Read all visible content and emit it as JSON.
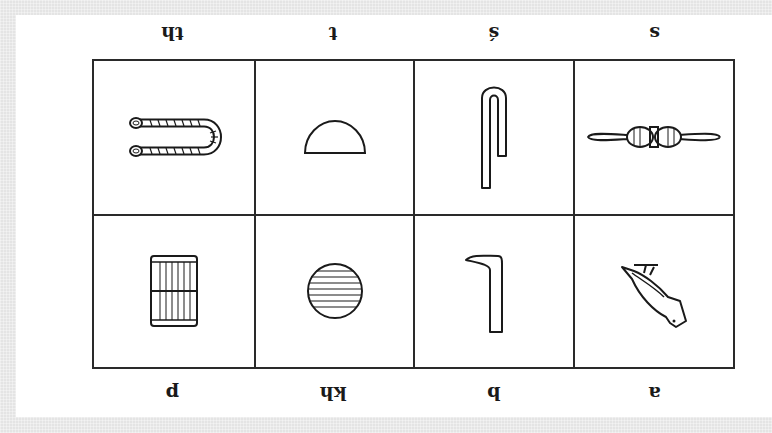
{
  "orientation": "rotated-180",
  "colors": {
    "ink": "#1a1a1a",
    "grid": "#2a2a2a",
    "panel": "#ffffff",
    "frame": "#e4e4e4"
  },
  "rows": [
    {
      "cells": [
        {
          "sound": "a",
          "glyph": "vulture-icon"
        },
        {
          "sound": "b",
          "glyph": "foot-icon"
        },
        {
          "sound": "kh",
          "glyph": "placenta-circle-icon"
        },
        {
          "sound": "p",
          "glyph": "stool-mat-icon"
        }
      ]
    },
    {
      "cells": [
        {
          "sound": "s",
          "glyph": "folded-cloth-icon"
        },
        {
          "sound": "ś",
          "glyph": "door-bolt-hook-icon"
        },
        {
          "sound": "t",
          "glyph": "bread-loaf-icon"
        },
        {
          "sound": "th",
          "glyph": "tethering-rope-icon"
        }
      ]
    }
  ]
}
